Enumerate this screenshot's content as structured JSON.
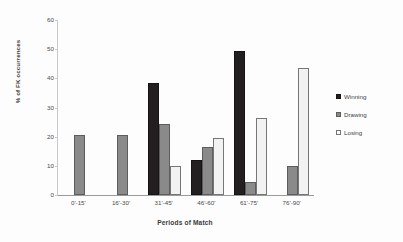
{
  "chart_data": {
    "type": "bar",
    "title": "",
    "xlabel": "Periods of Match",
    "ylabel": "% of FK occurrences",
    "ylim": [
      0,
      60
    ],
    "yticks": [
      0,
      10,
      20,
      30,
      40,
      50,
      60
    ],
    "grid": false,
    "legend_position": "right",
    "categories": [
      "0'-15'",
      "16'-30'",
      "31'-45'",
      "46'-60'",
      "61'-75'",
      "76'-90'"
    ],
    "series": [
      {
        "name": "Winning",
        "color": "#231f20",
        "values": [
          0,
          0,
          38.5,
          11.9,
          49.5,
          0
        ]
      },
      {
        "name": "Drawing",
        "color": "#8a8a8a",
        "values": [
          20.7,
          20.5,
          24.5,
          16.6,
          4.5,
          9.8
        ]
      },
      {
        "name": "Losing",
        "color": "#ffffff",
        "values": [
          0,
          0,
          9.8,
          19.5,
          26.5,
          43.4
        ]
      }
    ]
  }
}
